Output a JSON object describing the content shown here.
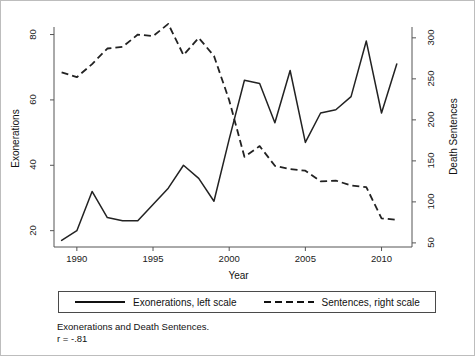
{
  "figure": {
    "caption_line1": "Exonerations and Death Sentences.",
    "caption_line2": "r = -.81"
  },
  "legend": {
    "entries": [
      {
        "label": "Exonerations, left scale",
        "style": "solid",
        "icon": "solid-line-icon"
      },
      {
        "label": "Sentences, right scale",
        "style": "dashed",
        "icon": "dashed-line-icon"
      }
    ]
  },
  "axes": {
    "left_title": "Exonerations",
    "right_title": "Death Sentences",
    "x_title": "Year",
    "left_ticks": [
      "20",
      "40",
      "60",
      "80"
    ],
    "right_ticks": [
      "50",
      "100",
      "150",
      "200",
      "250",
      "300"
    ],
    "x_ticks": [
      "1990",
      "1995",
      "2000",
      "2005",
      "2010"
    ]
  },
  "colors": {
    "line": "#222222",
    "axis": "#555555",
    "background": "#ffffff",
    "frame": "#bdbdbd"
  },
  "chart_data": {
    "type": "line",
    "title": "Exonerations and Death Sentences.",
    "xlabel": "Year",
    "ylabel": "Exonerations",
    "y2label": "Death Sentences",
    "xlim": [
      1988.5,
      2012
    ],
    "ylim": [
      15,
      82
    ],
    "y2lim": [
      45,
      312
    ],
    "grid": false,
    "legend_position": "below-plot",
    "annotation": "r = -.81",
    "correlation": -0.81,
    "x": [
      1989,
      1990,
      1991,
      1992,
      1993,
      1994,
      1995,
      1996,
      1997,
      1998,
      1999,
      2000,
      2001,
      2002,
      2003,
      2004,
      2005,
      2006,
      2007,
      2008,
      2009,
      2010,
      2011
    ],
    "series": [
      {
        "name": "Exonerations, left scale",
        "axis": "left",
        "style": "solid",
        "values": [
          17,
          20,
          32,
          24,
          23,
          23,
          28,
          33,
          40,
          36,
          29,
          48,
          66,
          65,
          53,
          69,
          47,
          56,
          57,
          61,
          78,
          56,
          71
        ]
      },
      {
        "name": "Sentences, right scale",
        "axis": "right",
        "style": "dashed",
        "values": [
          258,
          252,
          268,
          287,
          289,
          304,
          302,
          317,
          279,
          300,
          278,
          224,
          155,
          168,
          144,
          140,
          138,
          125,
          126,
          120,
          118,
          80,
          78
        ]
      }
    ]
  },
  "plot_geometry": {
    "left_px": 53,
    "right_px": 411,
    "top_px": 27,
    "bottom_px": 246
  }
}
